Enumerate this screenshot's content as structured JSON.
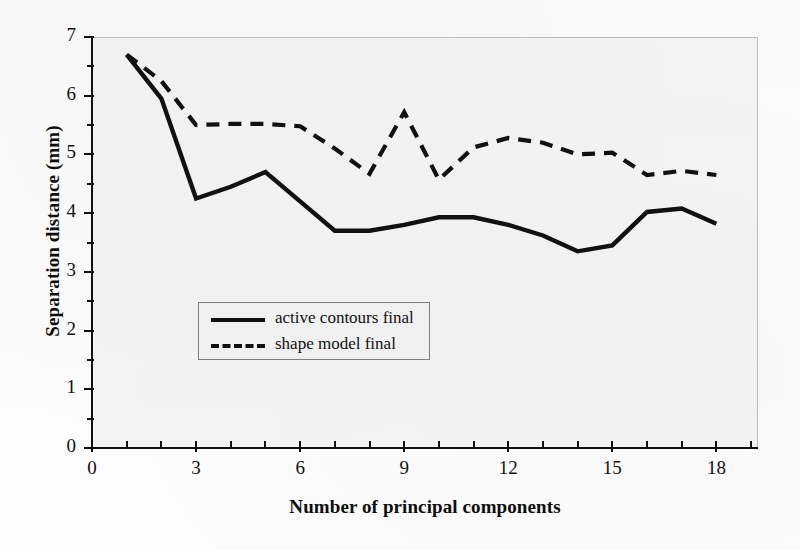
{
  "chart_data": {
    "type": "line",
    "title": "",
    "xlabel": "Number of principal components",
    "ylabel": "Separation distance (mm)",
    "xlim": [
      0,
      19.2
    ],
    "ylim": [
      0,
      7
    ],
    "xticks": [
      0,
      3,
      6,
      9,
      12,
      15,
      18
    ],
    "yticks": [
      0,
      1,
      2,
      3,
      4,
      5,
      6,
      7
    ],
    "x_minor_step": 1,
    "y_minor_step": 0.5,
    "grid": false,
    "legend_position": "center-left",
    "x": [
      1,
      2,
      3,
      4,
      5,
      6,
      7,
      8,
      9,
      10,
      11,
      12,
      13,
      14,
      15,
      16,
      17,
      18
    ],
    "series": [
      {
        "name": "active contours final",
        "style": "solid",
        "color": "#111111",
        "values": [
          6.7,
          5.95,
          4.25,
          4.45,
          4.7,
          4.2,
          3.7,
          3.7,
          3.8,
          3.93,
          3.93,
          3.8,
          3.62,
          3.35,
          3.45,
          4.02,
          4.08,
          3.82
        ]
      },
      {
        "name": "shape model final",
        "style": "dashed",
        "color": "#111111",
        "values": [
          6.7,
          6.25,
          5.5,
          5.52,
          5.52,
          5.48,
          5.1,
          4.67,
          5.72,
          4.57,
          5.12,
          5.28,
          5.2,
          5.0,
          5.03,
          4.65,
          4.72,
          4.65
        ]
      }
    ]
  },
  "axes": {
    "ytick_labels": [
      "0",
      "1",
      "2",
      "3",
      "4",
      "5",
      "6",
      "7"
    ],
    "xtick_labels": [
      "0",
      "3",
      "6",
      "9",
      "12",
      "15",
      "18"
    ]
  },
  "legend": {
    "entries": [
      {
        "label": "active contours final",
        "style": "solid"
      },
      {
        "label": "shape model final",
        "style": "dashed"
      }
    ]
  }
}
